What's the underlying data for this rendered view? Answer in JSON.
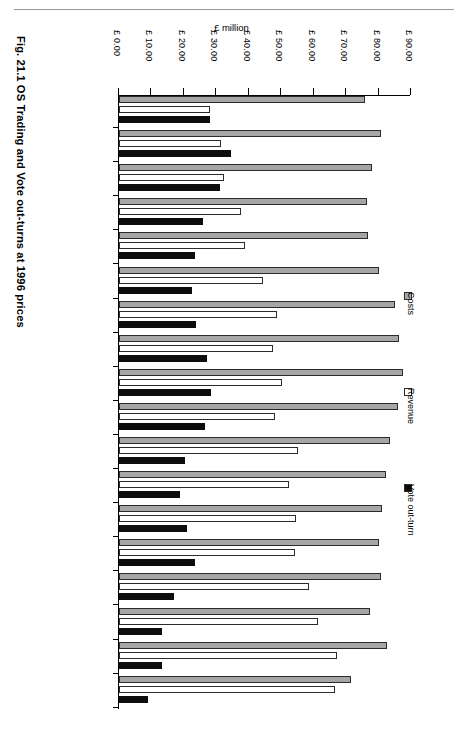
{
  "figure": {
    "caption": "Fig. 21.1   OS Trading and Vote out-turns at 1996 prices"
  },
  "legend": {
    "position": "right",
    "entries": [
      {
        "label": "Costs",
        "color": "#a6a6a6",
        "icon": "legend-swatch-costs"
      },
      {
        "label": "Revenue",
        "color": "#ffffff",
        "icon": "legend-swatch-revenue"
      },
      {
        "label": "Vote out-turn",
        "color": "#0d0d0d",
        "icon": "legend-swatch-vote"
      }
    ]
  },
  "chart_data": {
    "type": "bar",
    "orientation": "horizontal",
    "title": "",
    "xlabel": "£ million",
    "ylabel": "",
    "xlim": [
      0,
      90
    ],
    "xticks": [
      0,
      10,
      20,
      30,
      40,
      50,
      60,
      70,
      80,
      90
    ],
    "xticklabels": [
      "£ 0.00",
      "£ 10.00",
      "£ 20.00",
      "£ 30.00",
      "£ 40.00",
      "£ 50.00",
      "£ 60.00",
      "£ 70.00",
      "£ 80.00",
      "£ 90.00"
    ],
    "grid": false,
    "legend_position": "right",
    "categories": [
      "1979/80",
      "1980/81",
      "1981/82",
      "1982/83",
      "1983/84",
      "1984/85",
      "1985/86",
      "1986/87",
      "1987/88",
      "1988/89",
      "1989/90",
      "1990/91",
      "1991/92",
      "1992/93",
      "1993/94",
      "1994/95",
      "1995/96",
      "1996/97"
    ],
    "series": [
      {
        "name": "Costs",
        "color": "#a6a6a6",
        "values": [
          75.8,
          80.6,
          78.0,
          76.3,
          76.6,
          80.2,
          85.0,
          86.4,
          87.4,
          86.1,
          83.5,
          82.3,
          81.0,
          80.0,
          80.9,
          77.5,
          82.5,
          71.4
        ]
      },
      {
        "name": "Revenue",
        "color": "#ffffff",
        "values": [
          28.1,
          31.3,
          32.4,
          37.5,
          38.7,
          44.3,
          48.8,
          47.4,
          50.3,
          48.0,
          55.1,
          52.5,
          54.6,
          54.1,
          58.5,
          61.4,
          67.1,
          66.7
        ]
      },
      {
        "name": "Vote out-turn",
        "color": "#0d0d0d",
        "values": [
          28.1,
          34.4,
          31.0,
          26.0,
          23.3,
          22.6,
          23.8,
          27.2,
          28.4,
          26.5,
          20.2,
          18.7,
          20.9,
          23.3,
          17.0,
          13.2,
          13.4,
          8.9
        ]
      }
    ]
  }
}
